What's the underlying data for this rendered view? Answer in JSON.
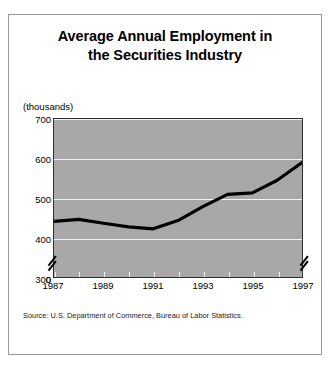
{
  "card": {
    "title_line_1": "Average Annual Employment in",
    "title_line_2": "the Securities Industry",
    "unit_label": "(thousands)",
    "source": "Source: U.S. Department of Commerce, Bureau of Labor Statistics."
  },
  "chart_data": {
    "type": "line",
    "title": "Average Annual Employment in the Securities Industry",
    "subtitle": "",
    "xlabel": "",
    "ylabel": "(thousands)",
    "unit": "thousands",
    "x": [
      1987,
      1988,
      1989,
      1990,
      1991,
      1992,
      1993,
      1994,
      1995,
      1996,
      1997
    ],
    "values": [
      441,
      446,
      436,
      427,
      422,
      443,
      478,
      509,
      513,
      545,
      590
    ],
    "series": [
      {
        "name": "Average annual employment",
        "values": [
          441,
          446,
          436,
          427,
          422,
          443,
          478,
          509,
          513,
          545,
          590
        ]
      }
    ],
    "xlim": [
      1987,
      1997
    ],
    "ylim": [
      300,
      700
    ],
    "y_ticks": [
      0,
      300,
      400,
      500,
      600,
      700
    ],
    "y_tick_labels": [
      "0",
      "300",
      "400",
      "500",
      "600",
      "700"
    ],
    "x_ticks": [
      1987,
      1988,
      1989,
      1990,
      1991,
      1992,
      1993,
      1994,
      1995,
      1996,
      1997
    ],
    "x_tick_labels_shown": [
      "1987",
      "1989",
      "1991",
      "1993",
      "1995",
      "1997"
    ],
    "axis_break": true,
    "axis_break_note": "y-axis broken between 0 and 300",
    "grid": true,
    "grid_color": "#f2f2f2",
    "legend": "none",
    "plot_background": "#a8a8a8",
    "line_color": "#000000",
    "line_width": 3
  },
  "y_axis": {
    "ticks": [
      {
        "label": "700",
        "value": 700
      },
      {
        "label": "600",
        "value": 600
      },
      {
        "label": "500",
        "value": 500
      },
      {
        "label": "400",
        "value": 400
      },
      {
        "label": "300",
        "value": 300
      },
      {
        "label": "0",
        "value": 0
      }
    ]
  },
  "x_axis": {
    "ticks": [
      {
        "label": "1987",
        "value": 1987
      },
      {
        "label": "1989",
        "value": 1989
      },
      {
        "label": "1991",
        "value": 1991
      },
      {
        "label": "1993",
        "value": 1993
      },
      {
        "label": "1995",
        "value": 1995
      },
      {
        "label": "1997",
        "value": 1997
      }
    ]
  }
}
